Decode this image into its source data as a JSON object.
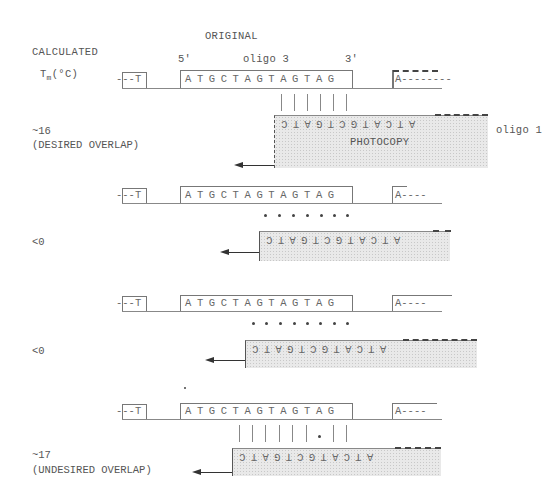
{
  "header": {
    "title": "ORIGINAL",
    "calc_label": "CALCULATED",
    "tm_label_T": "T",
    "tm_label_sub": "m",
    "tm_label_unit": "(°C)"
  },
  "template": {
    "five_prime": "5'",
    "three_prime": "3'",
    "oligo_label": "oligo 3",
    "left_flank": "---T",
    "core_sequence": "ATGCTAGTAGTAG",
    "right_flank_first": "A--------",
    "right_flank": "A----"
  },
  "photocopy": {
    "sequence_rotated": "ATCATGCTGATC",
    "label": "PHOTOCOPY",
    "oligo_label": "oligo 1"
  },
  "rows": [
    {
      "tm": "~16",
      "note": "(DESIRED OVERLAP)",
      "pairing": "bars",
      "pair_count": 6
    },
    {
      "tm": "<0",
      "note": "",
      "pairing": "dots",
      "pair_count": 7
    },
    {
      "tm": "<0",
      "note": "",
      "pairing": "dots",
      "pair_count": 8
    },
    {
      "tm": "~17",
      "note": "(UNDESIRED OVERLAP)",
      "pairing": "bars-with-mismatch",
      "pair_count": 9
    }
  ]
}
